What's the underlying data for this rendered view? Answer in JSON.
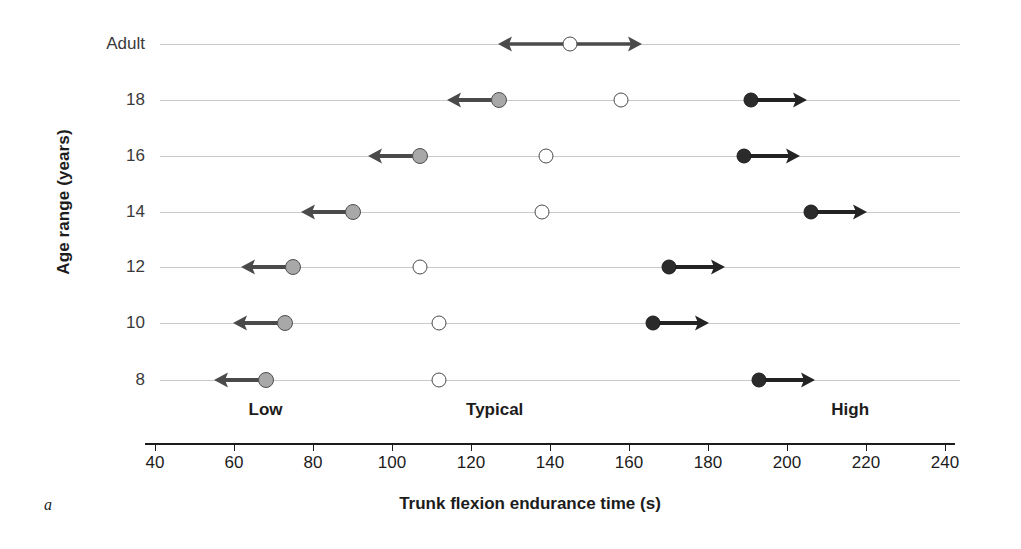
{
  "figure": {
    "panel_letter": "a",
    "x_axis_title": "Trunk flexion endurance time (s)",
    "y_axis_title": "Age range (years)"
  },
  "zones": [
    {
      "label": "Low",
      "x": 68
    },
    {
      "label": "Typical",
      "x": 126
    },
    {
      "label": "High",
      "x": 216
    }
  ],
  "chart_data": {
    "type": "scatter",
    "title": "",
    "xlabel": "Trunk flexion endurance time (s)",
    "ylabel": "Age range (years)",
    "xlim": [
      40,
      240
    ],
    "xticks": [
      40,
      60,
      80,
      100,
      120,
      140,
      160,
      180,
      200,
      220,
      240
    ],
    "categories": [
      "Adult",
      "18",
      "16",
      "14",
      "12",
      "10",
      "8"
    ],
    "grid": true,
    "legend": "none",
    "series": [
      {
        "name": "Low",
        "marker": "gray-filled-circle",
        "color": "#a8a8a8",
        "arrow": "left",
        "values": [
          null,
          127,
          107,
          90,
          75,
          73,
          68
        ]
      },
      {
        "name": "Typical",
        "marker": "open-circle",
        "color": "#ffffff",
        "arrow": "none",
        "values": [
          145,
          158,
          139,
          138,
          107,
          112,
          112
        ]
      },
      {
        "name": "High",
        "marker": "black-filled-circle",
        "color": "#2b2b2b",
        "arrow": "right",
        "values": [
          null,
          191,
          189,
          206,
          170,
          166,
          193
        ]
      }
    ],
    "rows": [
      {
        "category": "Adult",
        "low": null,
        "typical": 145,
        "high": null,
        "typical_arrows": "both"
      },
      {
        "category": "18",
        "low": 127,
        "typical": 158,
        "high": 191,
        "typical_arrows": "none"
      },
      {
        "category": "16",
        "low": 107,
        "typical": 139,
        "high": 189,
        "typical_arrows": "none"
      },
      {
        "category": "14",
        "low": 90,
        "typical": 138,
        "high": 206,
        "typical_arrows": "none"
      },
      {
        "category": "12",
        "low": 75,
        "typical": 107,
        "high": 170,
        "typical_arrows": "none"
      },
      {
        "category": "10",
        "low": 73,
        "typical": 112,
        "high": 166,
        "typical_arrows": "none"
      },
      {
        "category": "8",
        "low": 68,
        "typical": 112,
        "high": 193,
        "typical_arrows": "none"
      }
    ]
  }
}
